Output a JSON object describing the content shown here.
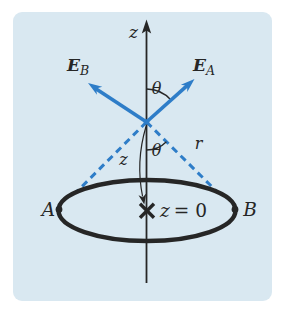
{
  "colors": {
    "page_bg": "#ffffff",
    "panel_bg": "#d9e8f1",
    "ink": "#262626",
    "accent": "#2e7dc8"
  },
  "labels": {
    "axis_z": "z",
    "field_b": {
      "main": "E",
      "sub": "B"
    },
    "field_a": {
      "main": "E",
      "sub": "A"
    },
    "theta_upper": "θ",
    "theta_lower": "θ",
    "r": "r",
    "z_distance": "z",
    "point_a": "A",
    "point_b": "B",
    "origin": {
      "variable": "z",
      "value": "= 0"
    }
  }
}
